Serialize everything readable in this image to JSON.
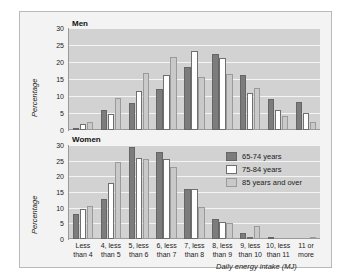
{
  "figure": {
    "background_color": "#f3f3f3",
    "border_color": "#b9b9b9",
    "plot_background_color": "#d2d2d2",
    "gridline_color": "#f4f4f4"
  },
  "legend": {
    "position": "inside-right-upper-of-women-panel",
    "items": [
      {
        "label": "65-74 years",
        "color": "#7c7c7c"
      },
      {
        "label": "75-84 years",
        "color": "#ffffff"
      },
      {
        "label": "85 years and over",
        "color": "#c9c9c9"
      }
    ]
  },
  "axis": {
    "ylabel": "Percentage",
    "xlabel": "Daily energy intake (MJ)",
    "yticks": [
      0,
      5,
      10,
      15,
      20,
      25,
      30
    ],
    "ylim": [
      0,
      30
    ]
  },
  "categories": [
    "Less\nthan 4",
    "4, less\nthan 5",
    "5, less\nthan 6",
    "6, less\nthan 7",
    "7, less\nthan 8",
    "8, less\nthan 9",
    "9, less\nthan 10",
    "10, less\nthan 11",
    "11 or\nmore"
  ],
  "chart_data": [
    {
      "type": "bar",
      "title": "Men",
      "xlabel": "Daily energy intake (MJ)",
      "ylabel": "Percentage",
      "ylim": [
        0,
        30
      ],
      "yticks": [
        0,
        5,
        10,
        15,
        20,
        25,
        30
      ],
      "grid": true,
      "categories": [
        "Less than 4",
        "4, less than 5",
        "5, less than 6",
        "6, less than 7",
        "7, less than 8",
        "8, less than 9",
        "9, less than 10",
        "10, less than 11",
        "11 or more"
      ],
      "series": [
        {
          "name": "65-74 years",
          "values": [
            0.6,
            5.8,
            8.0,
            12.2,
            18.6,
            22.3,
            16.2,
            9.1,
            8.1
          ]
        },
        {
          "name": "75-84 years",
          "values": [
            1.7,
            4.8,
            11.6,
            16.3,
            23.1,
            21.3,
            11.0,
            6.0,
            4.9
          ]
        },
        {
          "name": "85 years and over",
          "values": [
            2.3,
            9.5,
            16.8,
            21.4,
            15.6,
            16.5,
            12.3,
            4.0,
            2.4
          ]
        }
      ]
    },
    {
      "type": "bar",
      "title": "Women",
      "xlabel": "Daily energy intake (MJ)",
      "ylabel": "Percentage",
      "ylim": [
        0,
        30
      ],
      "yticks": [
        0,
        5,
        10,
        15,
        20,
        25,
        30
      ],
      "grid": true,
      "categories": [
        "Less than 4",
        "4, less than 5",
        "5, less than 6",
        "6, less than 7",
        "7, less than 8",
        "8, less than 9",
        "9, less than 10",
        "10, less than 11",
        "11 or more"
      ],
      "series": [
        {
          "name": "65-74 years",
          "values": [
            7.9,
            12.8,
            29.5,
            27.9,
            15.9,
            6.3,
            2.0,
            0.3,
            0.0
          ]
        },
        {
          "name": "75-84 years",
          "values": [
            9.5,
            17.9,
            26.0,
            25.6,
            16.1,
            5.5,
            0.3,
            0.0,
            0.0
          ]
        },
        {
          "name": "85 years and over",
          "values": [
            10.5,
            24.5,
            25.5,
            23.0,
            10.1,
            5.0,
            4.3,
            0.0,
            0.4
          ]
        }
      ]
    }
  ]
}
